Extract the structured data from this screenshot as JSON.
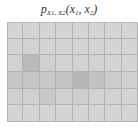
{
  "title": {
    "base": "p",
    "subscript": "X1, X2",
    "args": "(x",
    "arg1_sub": "1",
    "sep": ", x",
    "arg2_sub": "2",
    "close": ")"
  },
  "grid": {
    "rows": 6,
    "cols": 8,
    "base_color": "#d6d6d6",
    "line_color": "#b2b2b2",
    "cells": [
      [
        "#d4d4d4",
        "#d4d4d4",
        "#d4d4d4",
        "#d4d4d4",
        "#d4d4d4",
        "#d4d4d4",
        "#d4d4d4",
        "#d4d4d4"
      ],
      [
        "#d4d4d4",
        "#d2d2d2",
        "#d4d4d4",
        "#d4d4d4",
        "#d4d4d4",
        "#d4d4d4",
        "#d4d4d4",
        "#d4d4d4"
      ],
      [
        "#d2d2d2",
        "#bababa",
        "#d0d0d0",
        "#d2d2d2",
        "#d2d2d2",
        "#d2d2d2",
        "#d4d4d4",
        "#d4d4d4"
      ],
      [
        "#c6c6c6",
        "#c6c6c6",
        "#c8c8c8",
        "#c4c4c4",
        "#b6b6b6",
        "#c2c2c2",
        "#cccccc",
        "#d0d0d0"
      ],
      [
        "#d0d0d0",
        "#d0d0d0",
        "#c8c8c8",
        "#d0d0d0",
        "#cecece",
        "#d2d2d2",
        "#d2d2d2",
        "#d4d4d4"
      ],
      [
        "#d4d4d4",
        "#d4d4d4",
        "#d4d4d4",
        "#d4d4d4",
        "#d4d4d4",
        "#d4d4d4",
        "#d4d4d4",
        "#d4d4d4"
      ]
    ]
  }
}
